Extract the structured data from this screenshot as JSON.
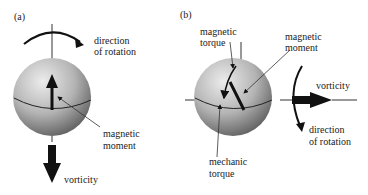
{
  "panels": [
    {
      "id": "a",
      "label": "(a)",
      "annotations": {
        "rotation": [
          "direction",
          "of rotation"
        ],
        "moment": [
          "magnetic",
          "moment"
        ],
        "vorticity": "vorticity"
      }
    },
    {
      "id": "b",
      "label": "(b)",
      "annotations": {
        "magnetic_torque": [
          "magnetic",
          "torque"
        ],
        "moment": [
          "magnetic",
          "moment"
        ],
        "vorticity": "vorticity",
        "rotation": [
          "direction",
          "of rotation"
        ],
        "mechanic_torque": [
          "mechanic",
          "torque"
        ]
      }
    }
  ],
  "colors": {
    "sphere_light": "#e6e6e6",
    "sphere_dark": "#6e6e6e",
    "ink": "#111111"
  }
}
